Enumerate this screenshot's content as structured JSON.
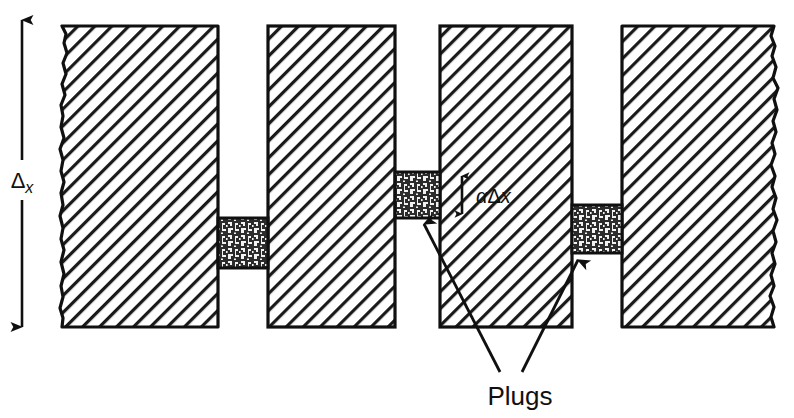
{
  "figure": {
    "type": "technical-cross-section-diagram",
    "background_color": "#ffffff",
    "line_color": "#101010",
    "hatch_color": "#1a1a1a",
    "plug_fill_color": "#2b2b2b",
    "width": 794,
    "height": 418
  },
  "labels": {
    "delta_x_symbol": "Δ",
    "delta_x_subscript": "x",
    "alpha_symbol": "α",
    "alpha_delta": "Δ",
    "alpha_x": "x",
    "plugs": "Plugs"
  },
  "annotations": {
    "height_dimension": {
      "name": "delta-x",
      "text": "Δx",
      "orientation": "vertical",
      "arrow_style": "double-headed",
      "x": 22,
      "y_top": 14,
      "y_bottom": 333
    },
    "gap_dimension": {
      "name": "alpha-delta-x",
      "text": "αΔx",
      "orientation": "vertical",
      "arrow_style": "double-headed",
      "x": 462,
      "y_top": 172,
      "y_bottom": 218
    },
    "plugs_callout": {
      "name": "plugs-callout",
      "text": "Plugs",
      "text_x": 520,
      "text_y": 400,
      "leaders": [
        {
          "from_x": 500,
          "from_y": 372,
          "to_x": 422,
          "to_y": 222
        },
        {
          "from_x": 522,
          "from_y": 372,
          "to_x": 580,
          "to_y": 258
        }
      ]
    }
  },
  "blocks": [
    {
      "name": "block-left",
      "x": 62,
      "y": 26,
      "width": 156,
      "height": 301,
      "torn_edge": "left",
      "fill": "diagonal-hatch"
    },
    {
      "name": "block-second",
      "x": 268,
      "y": 26,
      "width": 127,
      "height": 301,
      "torn_edge": "none",
      "fill": "diagonal-hatch"
    },
    {
      "name": "block-third",
      "x": 440,
      "y": 26,
      "width": 132,
      "height": 301,
      "torn_edge": "none",
      "fill": "diagonal-hatch"
    },
    {
      "name": "block-right",
      "x": 622,
      "y": 26,
      "width": 152,
      "height": 301,
      "torn_edge": "right",
      "fill": "diagonal-hatch"
    }
  ],
  "plugs": [
    {
      "name": "plug-1",
      "x": 218,
      "y": 218,
      "width": 50,
      "height": 50
    },
    {
      "name": "plug-2",
      "x": 395,
      "y": 172,
      "width": 45,
      "height": 46
    },
    {
      "name": "plug-3",
      "x": 572,
      "y": 205,
      "width": 50,
      "height": 48
    }
  ]
}
